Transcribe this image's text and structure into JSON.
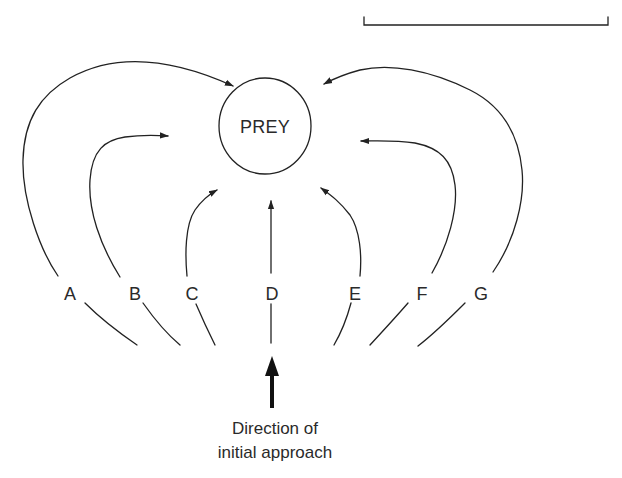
{
  "diagram": {
    "type": "approach-paths",
    "center_node": {
      "label": "PREY"
    },
    "scale_bar": {
      "label": ""
    },
    "paths": [
      {
        "id": "A",
        "label": "A",
        "trajectory": "wide-arc-left"
      },
      {
        "id": "B",
        "label": "B",
        "trajectory": "medium-arc-left"
      },
      {
        "id": "C",
        "label": "C",
        "trajectory": "short-arc-left"
      },
      {
        "id": "D",
        "label": "D",
        "trajectory": "straight"
      },
      {
        "id": "E",
        "label": "E",
        "trajectory": "short-arc-right"
      },
      {
        "id": "F",
        "label": "F",
        "trajectory": "medium-arc-right"
      },
      {
        "id": "G",
        "label": "G",
        "trajectory": "wide-arc-right"
      }
    ],
    "approach_arrow": {
      "icon": "thick-up-arrow",
      "caption_line1": "Direction of",
      "caption_line2": "initial approach"
    },
    "colors": {
      "ink": "#222222",
      "background": "#ffffff"
    }
  }
}
